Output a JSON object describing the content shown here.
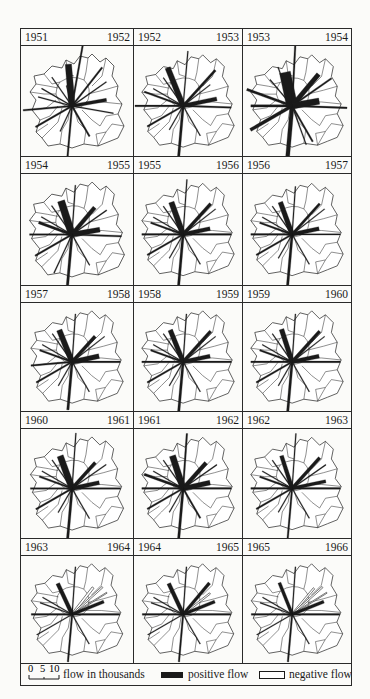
{
  "figure": {
    "type": "flow-map-series",
    "columns": 3,
    "panels": [
      {
        "from": "1951",
        "to": "1952",
        "flows": [
          [
            -5,
            6,
            4
          ],
          [
            10,
            9,
            1
          ],
          [
            38,
            7,
            1
          ],
          [
            55,
            6,
            0.6
          ],
          [
            80,
            5,
            2
          ],
          [
            100,
            6,
            0.6
          ],
          [
            150,
            5,
            1
          ],
          [
            185,
            8,
            1
          ],
          [
            205,
            4,
            0.6
          ],
          [
            240,
            6,
            1
          ],
          [
            265,
            7,
            1
          ],
          [
            285,
            5,
            0.6
          ],
          [
            300,
            5,
            0.6
          ],
          [
            325,
            5,
            0.6
          ],
          [
            345,
            3,
            0.6
          ]
        ],
        "neg": []
      },
      {
        "from": "1952",
        "to": "1953",
        "flows": [
          [
            -22,
            6,
            3.5
          ],
          [
            5,
            8,
            0.6
          ],
          [
            42,
            7,
            1.5
          ],
          [
            52,
            5,
            0.6
          ],
          [
            78,
            5,
            2.5
          ],
          [
            92,
            7,
            1
          ],
          [
            150,
            5,
            0.6
          ],
          [
            185,
            9,
            1.5
          ],
          [
            210,
            4,
            0.6
          ],
          [
            240,
            6,
            1
          ],
          [
            270,
            7,
            1
          ],
          [
            290,
            6,
            1
          ],
          [
            300,
            5,
            0.6
          ],
          [
            325,
            5,
            0.6
          ],
          [
            340,
            3,
            0.6
          ]
        ],
        "neg": []
      },
      {
        "from": "1953",
        "to": "1954",
        "flows": [
          [
            -12,
            5,
            7
          ],
          [
            3,
            9,
            1
          ],
          [
            40,
            6,
            3
          ],
          [
            55,
            7,
            1
          ],
          [
            80,
            4,
            4
          ],
          [
            92,
            8,
            1
          ],
          [
            150,
            6,
            1
          ],
          [
            185,
            9,
            2.5
          ],
          [
            160,
            6,
            0.6
          ],
          [
            240,
            7,
            2
          ],
          [
            270,
            6,
            1.5
          ],
          [
            290,
            7,
            1.5
          ],
          [
            320,
            5,
            0.6
          ],
          [
            340,
            6,
            0.6
          ]
        ],
        "neg": []
      },
      {
        "from": "1954",
        "to": "1955",
        "flows": [
          [
            -18,
            5,
            4.5
          ],
          [
            4,
            7,
            0.6
          ],
          [
            40,
            5,
            2.5
          ],
          [
            55,
            6,
            0.6
          ],
          [
            80,
            4,
            3
          ],
          [
            92,
            7,
            1
          ],
          [
            150,
            5,
            0.6
          ],
          [
            185,
            8,
            1.5
          ],
          [
            205,
            6,
            0.6
          ],
          [
            240,
            6,
            1
          ],
          [
            270,
            6,
            1
          ],
          [
            290,
            5,
            1.5
          ],
          [
            300,
            5,
            0.6
          ],
          [
            325,
            5,
            0.6
          ],
          [
            340,
            3,
            0.6
          ]
        ],
        "neg": []
      },
      {
        "from": "1955",
        "to": "1956",
        "flows": [
          [
            -20,
            5,
            3.5
          ],
          [
            4,
            8,
            0.6
          ],
          [
            42,
            6,
            2
          ],
          [
            52,
            6,
            0.6
          ],
          [
            78,
            4,
            2.5
          ],
          [
            90,
            7,
            1
          ],
          [
            150,
            5,
            0.6
          ],
          [
            185,
            8,
            1.5
          ],
          [
            210,
            4,
            0.6
          ],
          [
            240,
            6,
            1
          ],
          [
            270,
            6,
            1
          ],
          [
            290,
            5,
            1
          ],
          [
            300,
            5,
            0.6
          ],
          [
            325,
            5,
            0.6
          ]
        ],
        "neg": []
      },
      {
        "from": "1956",
        "to": "1957",
        "flows": [
          [
            -20,
            5,
            3
          ],
          [
            4,
            7,
            0.6
          ],
          [
            42,
            6,
            1.5
          ],
          [
            52,
            6,
            0.6
          ],
          [
            78,
            4,
            2.5
          ],
          [
            90,
            7,
            0.8
          ],
          [
            150,
            5,
            0.6
          ],
          [
            185,
            8,
            1.5
          ],
          [
            210,
            4,
            0.6
          ],
          [
            240,
            6,
            1
          ],
          [
            270,
            6,
            1
          ],
          [
            290,
            5,
            1
          ],
          [
            300,
            5,
            0.6
          ],
          [
            325,
            5,
            0.6
          ]
        ],
        "neg": []
      },
      {
        "from": "1957",
        "to": "1958",
        "flows": [
          [
            -22,
            5,
            3.5
          ],
          [
            4,
            7,
            0.6
          ],
          [
            42,
            5,
            2
          ],
          [
            52,
            6,
            0.6
          ],
          [
            78,
            4,
            3
          ],
          [
            90,
            7,
            1
          ],
          [
            150,
            5,
            0.6
          ],
          [
            185,
            7,
            1.5
          ],
          [
            210,
            4,
            0.6
          ],
          [
            240,
            6,
            1
          ],
          [
            265,
            6,
            1
          ],
          [
            290,
            5,
            1
          ],
          [
            300,
            5,
            0.6
          ],
          [
            325,
            5,
            0.6
          ]
        ],
        "neg": []
      },
      {
        "from": "1958",
        "to": "1959",
        "flows": [
          [
            -22,
            5,
            3
          ],
          [
            4,
            7,
            0.6
          ],
          [
            42,
            6,
            2
          ],
          [
            52,
            6,
            0.6
          ],
          [
            78,
            4,
            2.5
          ],
          [
            90,
            7,
            1
          ],
          [
            150,
            5,
            0.6
          ],
          [
            185,
            8,
            1.5
          ],
          [
            210,
            4,
            0.6
          ],
          [
            240,
            6,
            1
          ],
          [
            270,
            6,
            1
          ],
          [
            290,
            5,
            1
          ],
          [
            300,
            5,
            0.6
          ],
          [
            325,
            5,
            0.6
          ]
        ],
        "neg": []
      },
      {
        "from": "1959",
        "to": "1960",
        "flows": [
          [
            -18,
            5,
            3
          ],
          [
            4,
            7,
            0.6
          ],
          [
            42,
            6,
            2
          ],
          [
            52,
            6,
            0.6
          ],
          [
            78,
            4,
            2.5
          ],
          [
            90,
            7,
            1
          ],
          [
            150,
            5,
            0.6
          ],
          [
            185,
            8,
            1.5
          ],
          [
            210,
            4,
            0.6
          ],
          [
            240,
            6,
            1
          ],
          [
            270,
            6,
            1
          ],
          [
            290,
            5,
            1
          ],
          [
            300,
            5,
            0.6
          ],
          [
            325,
            5,
            0.6
          ]
        ],
        "neg": []
      },
      {
        "from": "1960",
        "to": "1961",
        "flows": [
          [
            -20,
            5,
            4
          ],
          [
            4,
            8,
            0.6
          ],
          [
            42,
            5,
            2
          ],
          [
            55,
            6,
            0.6
          ],
          [
            78,
            4,
            2.5
          ],
          [
            90,
            7,
            1
          ],
          [
            150,
            5,
            0.6
          ],
          [
            185,
            8,
            1.5
          ],
          [
            210,
            4,
            0.6
          ],
          [
            240,
            6,
            1
          ],
          [
            270,
            6,
            1
          ],
          [
            290,
            5,
            1
          ],
          [
            300,
            5,
            0.6
          ],
          [
            325,
            5,
            0.6
          ]
        ],
        "neg": []
      },
      {
        "from": "1961",
        "to": "1962",
        "flows": [
          [
            -18,
            5,
            4
          ],
          [
            4,
            8,
            1
          ],
          [
            42,
            5,
            2.5
          ],
          [
            55,
            6,
            0.6
          ],
          [
            78,
            4,
            3
          ],
          [
            90,
            7,
            1
          ],
          [
            150,
            5,
            1
          ],
          [
            185,
            8,
            1.5
          ],
          [
            210,
            4,
            0.6
          ],
          [
            240,
            6,
            1
          ],
          [
            270,
            6,
            1
          ],
          [
            290,
            6,
            1.5
          ],
          [
            300,
            5,
            0.6
          ],
          [
            325,
            5,
            0.6
          ]
        ],
        "neg": []
      },
      {
        "from": "1962",
        "to": "1963",
        "flows": [
          [
            -18,
            5,
            2.5
          ],
          [
            4,
            8,
            0.6
          ],
          [
            42,
            6,
            2
          ],
          [
            55,
            6,
            0.6
          ],
          [
            78,
            5,
            2
          ],
          [
            90,
            7,
            1
          ],
          [
            150,
            5,
            0.6
          ],
          [
            185,
            8,
            1
          ],
          [
            210,
            4,
            0.6
          ],
          [
            240,
            6,
            1
          ],
          [
            270,
            6,
            1
          ],
          [
            290,
            5,
            1
          ],
          [
            300,
            5,
            0.6
          ],
          [
            325,
            5,
            0.6
          ]
        ],
        "neg": []
      },
      {
        "from": "1963",
        "to": "1964",
        "flows": [
          [
            -25,
            5,
            2.5
          ],
          [
            4,
            7,
            0.6
          ],
          [
            68,
            5,
            2
          ],
          [
            90,
            7,
            1
          ],
          [
            150,
            5,
            0.6
          ],
          [
            185,
            7,
            1
          ],
          [
            240,
            6,
            0.6
          ],
          [
            270,
            6,
            1
          ],
          [
            290,
            5,
            0.6
          ],
          [
            300,
            5,
            0.6
          ]
        ],
        "neg": [
          [
            38,
            5,
            1.5
          ],
          [
            48,
            6,
            1
          ],
          [
            58,
            6,
            0.6
          ]
        ]
      },
      {
        "from": "1964",
        "to": "1965",
        "flows": [
          [
            -25,
            5,
            2.5
          ],
          [
            4,
            7,
            0.6
          ],
          [
            40,
            6,
            2
          ],
          [
            68,
            5,
            2
          ],
          [
            90,
            7,
            1
          ],
          [
            150,
            5,
            0.6
          ],
          [
            185,
            7,
            1
          ],
          [
            240,
            6,
            0.6
          ],
          [
            270,
            6,
            1
          ],
          [
            290,
            5,
            0.6
          ],
          [
            300,
            5,
            0.6
          ]
        ],
        "neg": [
          [
            52,
            5,
            1
          ]
        ]
      },
      {
        "from": "1965",
        "to": "1966",
        "flows": [
          [
            -22,
            5,
            2
          ],
          [
            4,
            7,
            0.6
          ],
          [
            68,
            5,
            2
          ],
          [
            90,
            7,
            1
          ],
          [
            150,
            5,
            0.6
          ],
          [
            185,
            7,
            1
          ],
          [
            240,
            6,
            0.6
          ],
          [
            270,
            6,
            1
          ],
          [
            290,
            5,
            0.6
          ],
          [
            300,
            5,
            0.6
          ]
        ],
        "neg": [
          [
            40,
            5,
            1.2
          ],
          [
            48,
            6,
            1
          ],
          [
            58,
            6,
            0.6
          ]
        ]
      }
    ],
    "flow_encoding": "each flow = [bearing_degrees, length_relative, width_thousands]"
  },
  "legend": {
    "scale_ticks": [
      "0",
      "5",
      "10"
    ],
    "scale_label": "flow in thousands",
    "positive_label": "positive flow",
    "negative_label": "negative flow"
  },
  "colors": {
    "ink": "#1a1a1a",
    "paper": "#fbfbf9"
  }
}
